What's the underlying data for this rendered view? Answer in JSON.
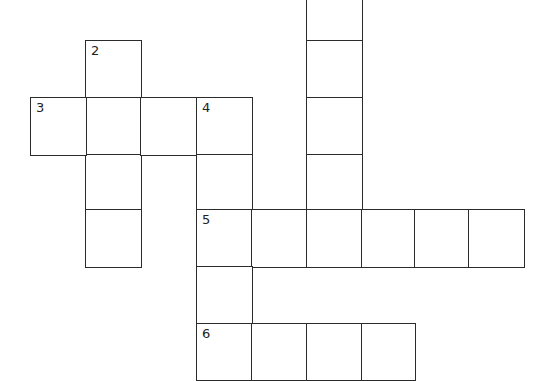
{
  "puzzle": {
    "clues": [
      {
        "number": "2",
        "direction": "down",
        "length": 4
      },
      {
        "number": "3",
        "direction": "across",
        "length": 4
      },
      {
        "number": "4",
        "direction": "down",
        "length": 5
      },
      {
        "number": "5",
        "direction": "across",
        "length": 6
      },
      {
        "number": "6",
        "direction": "across",
        "length": 4
      }
    ],
    "cells": [
      {
        "row": 0,
        "col": 5,
        "number": "",
        "letter": ""
      },
      {
        "row": 1,
        "col": 5,
        "number": "",
        "letter": ""
      },
      {
        "row": 2,
        "col": 5,
        "number": "",
        "letter": ""
      },
      {
        "row": 3,
        "col": 5,
        "number": "",
        "letter": ""
      },
      {
        "row": 1,
        "col": 1,
        "number": "2",
        "letter": ""
      },
      {
        "row": 2,
        "col": 1,
        "number": "",
        "letter": ""
      },
      {
        "row": 3,
        "col": 1,
        "number": "",
        "letter": ""
      },
      {
        "row": 4,
        "col": 1,
        "number": "",
        "letter": ""
      },
      {
        "row": 2,
        "col": 0,
        "number": "3",
        "letter": ""
      },
      {
        "row": 2,
        "col": 2,
        "number": "",
        "letter": ""
      },
      {
        "row": 2,
        "col": 3,
        "number": "4",
        "letter": ""
      },
      {
        "row": 3,
        "col": 3,
        "number": "",
        "letter": ""
      },
      {
        "row": 4,
        "col": 3,
        "number": "5",
        "letter": ""
      },
      {
        "row": 4,
        "col": 4,
        "number": "",
        "letter": ""
      },
      {
        "row": 4,
        "col": 5,
        "number": "",
        "letter": ""
      },
      {
        "row": 4,
        "col": 6,
        "number": "",
        "letter": ""
      },
      {
        "row": 4,
        "col": 7,
        "number": "",
        "letter": ""
      },
      {
        "row": 4,
        "col": 8,
        "number": "",
        "letter": ""
      },
      {
        "row": 5,
        "col": 3,
        "number": "",
        "letter": ""
      },
      {
        "row": 6,
        "col": 3,
        "number": "6",
        "letter": ""
      },
      {
        "row": 6,
        "col": 4,
        "number": "",
        "letter": ""
      },
      {
        "row": 6,
        "col": 5,
        "number": "",
        "letter": ""
      },
      {
        "row": 6,
        "col": 6,
        "number": "",
        "letter": ""
      }
    ]
  }
}
